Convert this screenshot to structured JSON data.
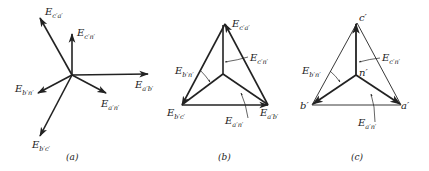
{
  "figure": {
    "panels": [
      {
        "caption": "(a)",
        "labels": {
          "ecpap": {
            "main": "E",
            "sub": "c′a′"
          },
          "ecpnp": {
            "main": "E",
            "sub": "c′n′"
          },
          "eapbp": {
            "main": "E",
            "sub": "a′b′"
          },
          "eapnp": {
            "main": "E",
            "sub": "a′n′"
          },
          "ebpnp": {
            "main": "E",
            "sub": "b′n′"
          },
          "ebpcp": {
            "main": "E",
            "sub": "b′c′"
          }
        }
      },
      {
        "caption": "(b)",
        "labels": {
          "ecpap": {
            "main": "E",
            "sub": "c′a′"
          },
          "ecpnp": {
            "main": "E",
            "sub": "c′n′"
          },
          "ebpnp": {
            "main": "E",
            "sub": "b′n′"
          },
          "ebpcp": {
            "main": "E",
            "sub": "b′c′"
          },
          "eapnp": {
            "main": "E",
            "sub": "a′n′"
          },
          "eapbp": {
            "main": "E",
            "sub": "a′b′"
          }
        }
      },
      {
        "caption": "(c)",
        "vertices": {
          "top": "c′",
          "left": "b′",
          "right": "a′",
          "center": "n′"
        },
        "labels": {
          "ecpnp": {
            "main": "E",
            "sub": "c′n′"
          },
          "ebpnp": {
            "main": "E",
            "sub": "b′n′"
          },
          "eapnp": {
            "main": "E",
            "sub": "a′n′"
          }
        }
      }
    ]
  }
}
